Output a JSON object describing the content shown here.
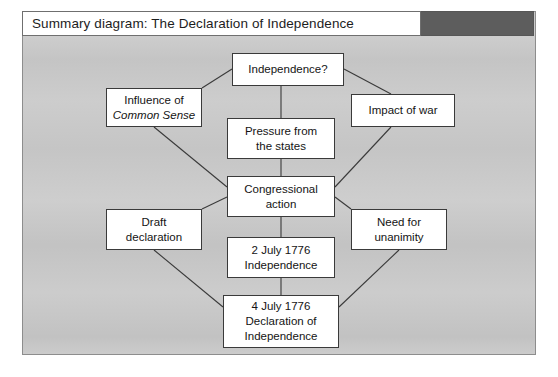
{
  "header": {
    "title": "Summary diagram: The Declaration of Independence",
    "swatch_color": "#5d5d5d"
  },
  "colors": {
    "panel_background": "#c9c9c9",
    "panel_border": "#8d8d8d",
    "node_fill": "#ffffff",
    "node_border": "#3a3a3a",
    "connector": "#3a3a3a",
    "text": "#141414"
  },
  "diagram": {
    "type": "flowchart",
    "nodes": [
      {
        "id": "independence_q",
        "lines": [
          {
            "text": "Independence?",
            "italic": false
          }
        ],
        "x": 210,
        "y": 42,
        "w": 112,
        "h": 33
      },
      {
        "id": "influence_common_sense",
        "lines": [
          {
            "text": "Influence of",
            "italic": false
          },
          {
            "text": "Common Sense",
            "italic": true
          }
        ],
        "x": 84,
        "y": 77,
        "w": 96,
        "h": 39
      },
      {
        "id": "impact_of_war",
        "lines": [
          {
            "text": "Impact of war",
            "italic": false
          }
        ],
        "x": 329,
        "y": 83,
        "w": 104,
        "h": 33
      },
      {
        "id": "pressure_from_states",
        "lines": [
          {
            "text": "Pressure from",
            "italic": false
          },
          {
            "text": "the states",
            "italic": false
          }
        ],
        "x": 205,
        "y": 107,
        "w": 108,
        "h": 41
      },
      {
        "id": "congressional_action",
        "lines": [
          {
            "text": "Congressional",
            "italic": false
          },
          {
            "text": "action",
            "italic": false
          }
        ],
        "x": 205,
        "y": 165,
        "w": 108,
        "h": 41
      },
      {
        "id": "draft_declaration",
        "lines": [
          {
            "text": "Draft",
            "italic": false
          },
          {
            "text": "declaration",
            "italic": false
          }
        ],
        "x": 84,
        "y": 198,
        "w": 96,
        "h": 41
      },
      {
        "id": "need_for_unanimity",
        "lines": [
          {
            "text": "Need for",
            "italic": false
          },
          {
            "text": "unanimity",
            "italic": false
          }
        ],
        "x": 329,
        "y": 198,
        "w": 96,
        "h": 41
      },
      {
        "id": "two_july_1776",
        "lines": [
          {
            "text": "2 July 1776",
            "italic": false
          },
          {
            "text": "Independence",
            "italic": false
          }
        ],
        "x": 205,
        "y": 226,
        "w": 108,
        "h": 41
      },
      {
        "id": "four_july_1776",
        "lines": [
          {
            "text": "4 July 1776",
            "italic": false
          },
          {
            "text": "Declaration of",
            "italic": false
          },
          {
            "text": "Independence",
            "italic": false
          }
        ],
        "x": 201,
        "y": 284,
        "w": 116,
        "h": 53
      }
    ],
    "connectors": [
      {
        "from": "influence_common_sense",
        "to": "independence_q",
        "x1": 180,
        "y1": 77,
        "x2": 210,
        "y2": 58
      },
      {
        "from": "independence_q",
        "to": "impact_of_war",
        "x1": 322,
        "y1": 58,
        "x2": 369,
        "y2": 83
      },
      {
        "from": "independence_q",
        "to": "pressure_from_states",
        "x1": 259,
        "y1": 75,
        "x2": 259,
        "y2": 107
      },
      {
        "from": "pressure_from_states",
        "to": "congressional_action",
        "x1": 259,
        "y1": 148,
        "x2": 259,
        "y2": 165
      },
      {
        "from": "influence_common_sense",
        "to": "congressional_action",
        "x1": 132,
        "y1": 116,
        "x2": 205,
        "y2": 176
      },
      {
        "from": "impact_of_war",
        "to": "congressional_action",
        "x1": 369,
        "y1": 116,
        "x2": 313,
        "y2": 176
      },
      {
        "from": "draft_declaration",
        "to": "congressional_action",
        "x1": 180,
        "y1": 198,
        "x2": 205,
        "y2": 186
      },
      {
        "from": "congressional_action",
        "to": "need_for_unanimity",
        "x1": 313,
        "y1": 186,
        "x2": 329,
        "y2": 198
      },
      {
        "from": "congressional_action",
        "to": "two_july_1776",
        "x1": 259,
        "y1": 206,
        "x2": 259,
        "y2": 226
      },
      {
        "from": "two_july_1776",
        "to": "four_july_1776",
        "x1": 259,
        "y1": 267,
        "x2": 259,
        "y2": 284
      },
      {
        "from": "draft_declaration",
        "to": "four_july_1776",
        "x1": 132,
        "y1": 239,
        "x2": 201,
        "y2": 296
      },
      {
        "from": "need_for_unanimity",
        "to": "four_july_1776",
        "x1": 377,
        "y1": 239,
        "x2": 317,
        "y2": 296
      }
    ]
  }
}
